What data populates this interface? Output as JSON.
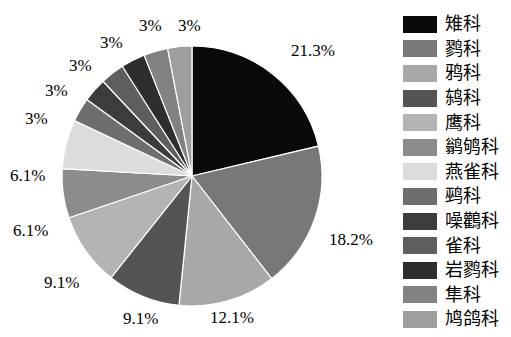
{
  "chart_data": {
    "type": "pie",
    "title": "",
    "xlabel": "",
    "ylabel": "",
    "legend_position": "right",
    "grid": false,
    "start_angle_deg": 90,
    "direction": "clockwise",
    "categories": [
      "雉科",
      "鹨科",
      "鸦科",
      "鸫科",
      "鹰科",
      "鹟鸲科",
      "燕雀科",
      "鹀科",
      "噪鸛科",
      "雀科",
      "岩鹨科",
      "隼科",
      "鸠鸽科"
    ],
    "values": [
      21.3,
      18.2,
      12.1,
      9.1,
      9.1,
      6.1,
      6.1,
      3,
      3,
      3,
      3,
      3,
      3
    ],
    "value_labels": [
      "21.3%",
      "18.2%",
      "12.1%",
      "9.1%",
      "9.1%",
      "6.1%",
      "6.1%",
      "3%",
      "3%",
      "3%",
      "3%",
      "3%",
      "3%"
    ],
    "colors": [
      "#0a0a0a",
      "#787878",
      "#a8a8a8",
      "#545454",
      "#b4b4b4",
      "#8c8c8c",
      "#dcdcdc",
      "#6e6e6e",
      "#3c3c3c",
      "#5e5e5e",
      "#2e2e2e",
      "#828282",
      "#9e9e9e"
    ]
  },
  "legend": {
    "items": [
      {
        "label": "雉科",
        "color": "#0a0a0a"
      },
      {
        "label": "鹨科",
        "color": "#787878"
      },
      {
        "label": "鸦科",
        "color": "#a8a8a8"
      },
      {
        "label": "鸫科",
        "color": "#545454"
      },
      {
        "label": "鹰科",
        "color": "#b4b4b4"
      },
      {
        "label": "鹟鸲科",
        "color": "#8c8c8c"
      },
      {
        "label": "燕雀科",
        "color": "#dcdcdc"
      },
      {
        "label": "鹀科",
        "color": "#6e6e6e"
      },
      {
        "label": "噪鸛科",
        "color": "#3c3c3c"
      },
      {
        "label": "雀科",
        "color": "#5e5e5e"
      },
      {
        "label": "岩鹨科",
        "color": "#2e2e2e"
      },
      {
        "label": "隼科",
        "color": "#828282"
      },
      {
        "label": "鸠鸽科",
        "color": "#9e9e9e"
      }
    ]
  },
  "labels": {
    "positions": [
      {
        "text": "21.3%",
        "x": 291,
        "y": 42
      },
      {
        "text": "18.2%",
        "x": 329,
        "y": 231
      },
      {
        "text": "12.1%",
        "x": 210,
        "y": 309
      },
      {
        "text": "9.1%",
        "x": 123,
        "y": 310
      },
      {
        "text": "9.1%",
        "x": 44,
        "y": 274
      },
      {
        "text": "6.1%",
        "x": 13,
        "y": 222
      },
      {
        "text": "6.1%",
        "x": 10,
        "y": 167
      },
      {
        "text": "3%",
        "x": 25,
        "y": 110
      },
      {
        "text": "3%",
        "x": 45,
        "y": 82
      },
      {
        "text": "3%",
        "x": 69,
        "y": 57
      },
      {
        "text": "3%",
        "x": 100,
        "y": 34
      },
      {
        "text": "3%",
        "x": 139,
        "y": 17
      },
      {
        "text": "3%",
        "x": 178,
        "y": 17
      }
    ]
  }
}
